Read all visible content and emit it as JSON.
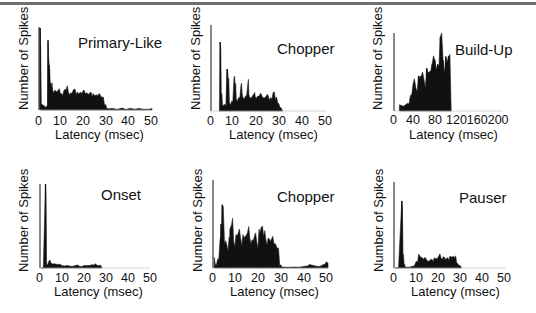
{
  "header": {
    "rule_color": "#6f6f6f"
  },
  "chart_data": [
    {
      "type": "bar",
      "panel": "top-left",
      "title": "Primary-Like",
      "xlabel": "Latency (msec)",
      "ylabel": "Number of Spikes",
      "xlim": [
        0,
        50
      ],
      "xticks": [
        "0",
        "10",
        "20",
        "30",
        "40",
        "50"
      ],
      "grid": false,
      "x": [
        0.5,
        1,
        1.5,
        2,
        2.5,
        3,
        3.5,
        4,
        4.5,
        5,
        5.5,
        6,
        7,
        8,
        9,
        10,
        11,
        12,
        13,
        14,
        15,
        16,
        17,
        18,
        19,
        20,
        21,
        22,
        23,
        24,
        25,
        26,
        27,
        28,
        29,
        30,
        32,
        34,
        36,
        38,
        40,
        42,
        44,
        46,
        48,
        50
      ],
      "values": [
        100,
        8,
        6,
        5,
        4,
        4,
        5,
        85,
        55,
        32,
        28,
        25,
        24,
        22,
        26,
        20,
        24,
        25,
        22,
        21,
        23,
        25,
        22,
        21,
        20,
        24,
        21,
        19,
        22,
        20,
        18,
        17,
        19,
        16,
        6,
        2,
        2,
        1,
        2,
        1,
        2,
        1,
        2,
        1,
        1,
        2
      ]
    },
    {
      "type": "bar",
      "panel": "top-middle",
      "title": "Chopper",
      "xlabel": "Latency (msec)",
      "ylabel": "Number of Spikes",
      "xlim": [
        0,
        50
      ],
      "xticks": [
        "0",
        "10",
        "20",
        "30",
        "40",
        "50"
      ],
      "grid": false,
      "x": [
        3.5,
        4,
        4.5,
        5,
        6,
        7,
        7.5,
        8,
        9,
        10,
        10.5,
        11,
        12,
        13,
        13.5,
        14,
        15,
        16,
        16.5,
        17,
        18,
        19,
        19.5,
        20,
        21,
        22,
        23,
        24,
        25,
        26,
        27,
        28,
        29,
        30,
        31
      ],
      "values": [
        0,
        82,
        20,
        6,
        8,
        50,
        35,
        10,
        12,
        40,
        28,
        14,
        16,
        30,
        22,
        16,
        18,
        32,
        20,
        16,
        18,
        22,
        16,
        17,
        18,
        19,
        16,
        18,
        17,
        16,
        22,
        14,
        10,
        4,
        1
      ]
    },
    {
      "type": "bar",
      "panel": "top-right",
      "title": "Build-Up",
      "xlabel": "Latency (msec)",
      "ylabel": "Number of Spikes",
      "xlim": [
        0,
        200
      ],
      "xticks": [
        "0",
        "40",
        "80",
        "120",
        "160",
        "200"
      ],
      "grid": false,
      "x": [
        10,
        25,
        30,
        35,
        40,
        45,
        50,
        55,
        60,
        65,
        70,
        75,
        80,
        85,
        90,
        95,
        100,
        105
      ],
      "values": [
        8,
        10,
        20,
        35,
        30,
        45,
        45,
        40,
        55,
        50,
        60,
        65,
        60,
        95,
        65,
        70,
        70,
        0
      ]
    },
    {
      "type": "bar",
      "panel": "bottom-left",
      "title": "Onset",
      "xlabel": "Latency (msec)",
      "ylabel": "Number of Spikes",
      "xlim": [
        0,
        50
      ],
      "xticks": [
        "0",
        "10",
        "20",
        "30",
        "40",
        "50"
      ],
      "grid": false,
      "x": [
        0.5,
        2.5,
        3,
        4,
        5,
        6,
        8,
        10,
        12,
        14,
        16,
        18,
        20,
        22,
        24,
        25,
        26,
        27,
        28
      ],
      "values": [
        0,
        100,
        4,
        8,
        6,
        5,
        4,
        3,
        3,
        2,
        3,
        2,
        3,
        3,
        4,
        5,
        3,
        3,
        1
      ]
    },
    {
      "type": "bar",
      "panel": "bottom-middle",
      "title": "Chopper",
      "xlabel": "Latency (msec)",
      "ylabel": "Number of Spikes",
      "xlim": [
        0,
        50
      ],
      "xticks": [
        "0",
        "10",
        "20",
        "30",
        "40",
        "50"
      ],
      "grid": false,
      "x": [
        0.5,
        1,
        2,
        3,
        3.5,
        4,
        5,
        6,
        7,
        7.5,
        8,
        9,
        10,
        11,
        12,
        13,
        14,
        15,
        16,
        17,
        18,
        19,
        20,
        21,
        22,
        23,
        24,
        25,
        26,
        27,
        28,
        29,
        30,
        35,
        40,
        42,
        45,
        48,
        49,
        50
      ],
      "values": [
        12,
        4,
        10,
        30,
        50,
        72,
        28,
        26,
        35,
        45,
        48,
        30,
        38,
        40,
        34,
        38,
        36,
        40,
        34,
        32,
        36,
        30,
        44,
        46,
        36,
        32,
        34,
        30,
        36,
        28,
        22,
        3,
        1,
        1,
        2,
        4,
        2,
        4,
        6,
        5
      ]
    },
    {
      "type": "bar",
      "panel": "bottom-right",
      "title": "Pauser",
      "xlabel": "Latency (msec)",
      "ylabel": "Number of Spikes",
      "xlim": [
        0,
        50
      ],
      "xticks": [
        "0",
        "10",
        "20",
        "30",
        "40",
        "50"
      ],
      "grid": false,
      "x": [
        0.5,
        3.5,
        4,
        4.5,
        5,
        6,
        8,
        10,
        11,
        12,
        13,
        14,
        15,
        16,
        17,
        18,
        19,
        20,
        21,
        22,
        23,
        24,
        25,
        26,
        27,
        28,
        29,
        30
      ],
      "values": [
        0,
        78,
        15,
        4,
        1,
        1,
        2,
        8,
        16,
        12,
        10,
        12,
        8,
        9,
        10,
        12,
        11,
        14,
        12,
        13,
        10,
        12,
        14,
        13,
        12,
        6,
        3,
        1
      ]
    }
  ],
  "panels": [
    {
      "title": "Primary-Like",
      "ylabel": "Number of Spikes",
      "xlabel": "Latency (msec)",
      "ticks": [
        "0",
        "10",
        "20",
        "30",
        "40",
        "50"
      ]
    },
    {
      "title": "Chopper",
      "ylabel": "Number of Spikes",
      "xlabel": "Latency (msec)",
      "ticks": [
        "0",
        "10",
        "20",
        "30",
        "40",
        "50"
      ]
    },
    {
      "title": "Build-Up",
      "ylabel": "Number of Spikes",
      "xlabel": "Latency (msec)",
      "ticks": [
        "0",
        "40",
        "80",
        "120160200"
      ]
    },
    {
      "title": "Onset",
      "ylabel": "Number of Spikes",
      "xlabel": "Latency (msec)",
      "ticks": [
        "0",
        "10",
        "20",
        "30",
        "40",
        "50"
      ]
    },
    {
      "title": "Chopper",
      "ylabel": "Number of Spikes",
      "xlabel": "Latency (msec)",
      "ticks": [
        "0",
        "10",
        "20",
        "30",
        "40",
        "50"
      ]
    },
    {
      "title": "Pauser",
      "ylabel": "Number of Spikes",
      "xlabel": "Latency (msec)",
      "ticks": [
        "0",
        "10",
        "20",
        "30",
        "40",
        "50"
      ]
    }
  ]
}
